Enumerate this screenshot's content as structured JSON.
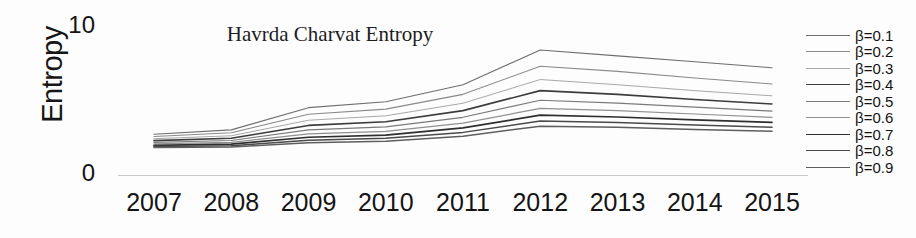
{
  "chart_data": {
    "type": "line",
    "title": "Havrda Charvat Entropy",
    "xlabel": "",
    "ylabel": "Entropy",
    "categories": [
      "2007",
      "2008",
      "2009",
      "2010",
      "2011",
      "2012",
      "2013",
      "2014",
      "2015"
    ],
    "x": [
      2007,
      2008,
      2009,
      2010,
      2011,
      2012,
      2013,
      2014,
      2015
    ],
    "ylim": [
      0,
      10
    ],
    "yticks": [
      0,
      10
    ],
    "ytick_labels": [
      "0",
      "10"
    ],
    "grid": false,
    "legend_position": "right",
    "series": [
      {
        "name": "β=0.1",
        "color": "#6e6e6e",
        "width": 1.1,
        "values": [
          2.75,
          3.05,
          4.55,
          4.95,
          6.1,
          8.45,
          8.05,
          7.65,
          7.25
        ]
      },
      {
        "name": "β=0.2",
        "color": "#8a8a8a",
        "width": 1.1,
        "values": [
          2.6,
          2.85,
          4.1,
          4.45,
          5.45,
          7.35,
          7.0,
          6.55,
          6.15
        ]
      },
      {
        "name": "β=0.3",
        "color": "#a8a8a8",
        "width": 1.0,
        "values": [
          2.45,
          2.65,
          3.7,
          4.0,
          4.85,
          6.45,
          6.1,
          5.7,
          5.35
        ]
      },
      {
        "name": "β=0.4",
        "color": "#3c3c3c",
        "width": 1.6,
        "values": [
          2.32,
          2.48,
          3.35,
          3.6,
          4.35,
          5.7,
          5.45,
          5.1,
          4.8
        ]
      },
      {
        "name": "β=0.5",
        "color": "#7a7a7a",
        "width": 1.2,
        "values": [
          2.2,
          2.33,
          3.05,
          3.25,
          3.9,
          5.05,
          4.85,
          4.58,
          4.32
        ]
      },
      {
        "name": "β=0.6",
        "color": "#909090",
        "width": 1.2,
        "values": [
          2.1,
          2.2,
          2.78,
          2.95,
          3.5,
          4.5,
          4.35,
          4.12,
          3.9
        ]
      },
      {
        "name": "β=0.7",
        "color": "#2e2e2e",
        "width": 1.7,
        "values": [
          2.0,
          2.08,
          2.55,
          2.7,
          3.18,
          4.05,
          3.92,
          3.72,
          3.55
        ]
      },
      {
        "name": "β=0.8",
        "color": "#4a4a4a",
        "width": 1.5,
        "values": [
          1.92,
          1.98,
          2.35,
          2.48,
          2.88,
          3.65,
          3.55,
          3.38,
          3.22
        ]
      },
      {
        "name": "β=0.9",
        "color": "#5e5e5e",
        "width": 1.5,
        "values": [
          1.85,
          1.9,
          2.18,
          2.28,
          2.62,
          3.3,
          3.22,
          3.08,
          2.95
        ]
      }
    ]
  },
  "axes": {
    "ylabel": "Entropy",
    "ytick_top": "10",
    "ytick_bottom": "0"
  }
}
